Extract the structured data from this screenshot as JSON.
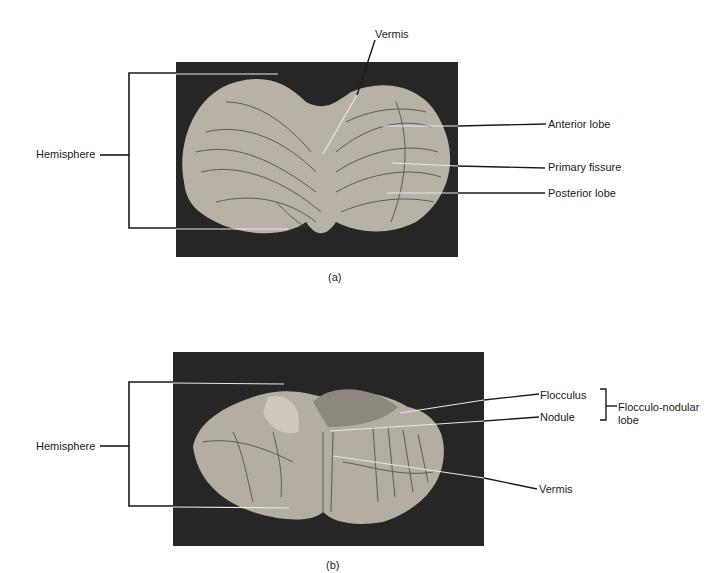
{
  "figure_a": {
    "caption": "(a)",
    "labels": {
      "vermis": "Vermis",
      "hemisphere": "Hemisphere",
      "anterior_lobe": "Anterior lobe",
      "primary_fissure": "Primary fissure",
      "posterior_lobe": "Posterior lobe"
    }
  },
  "figure_b": {
    "caption": "(b)",
    "labels": {
      "hemisphere": "Hemisphere",
      "flocculus": "Flocculus",
      "nodule": "Nodule",
      "flocculo_nodular_line1": "Flocculo-nodular",
      "flocculo_nodular_line2": "lobe",
      "vermis": "Vermis"
    }
  },
  "colors": {
    "photo_background": "#262626",
    "tissue": "#b8b2a6",
    "leader_line": "#1a1a1a",
    "leader_line_light": "#e8e8e8"
  }
}
